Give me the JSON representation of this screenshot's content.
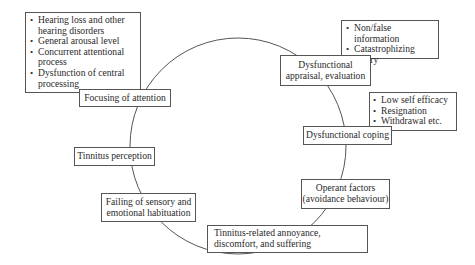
{
  "diagram": {
    "type": "cyclical model",
    "cycle_nodes": [
      {
        "id": "focusing",
        "label": "Focusing of attention"
      },
      {
        "id": "appraisal",
        "label_lines": [
          "Dysfunctional",
          "appraisal, evaluation"
        ]
      },
      {
        "id": "coping",
        "label": "Dysfunctional coping"
      },
      {
        "id": "operant",
        "label_lines": [
          "Operant factors",
          "(avoidance behaviour)"
        ]
      },
      {
        "id": "annoyance",
        "label_lines": [
          "Tinnitus-related annoyance,",
          "discomfort, and suffering"
        ]
      },
      {
        "id": "habituation",
        "label_lines": [
          "Failing of sensory and",
          "emotional habituation"
        ]
      },
      {
        "id": "perception",
        "label": "Tinnitus perception"
      }
    ],
    "annotations": {
      "focusing": [
        "Hearing loss and other hearing disorders",
        "General arousal level",
        "Concurrent attentional process",
        "Dysfunction of central processing"
      ],
      "appraisal": [
        "Non/false information",
        "Catastrophizing",
        "Worry"
      ],
      "coping": [
        "Low self efficacy",
        "Resignation",
        "Withdrawal etc."
      ]
    },
    "colors": {
      "line": "#555555",
      "text": "#2a2a2a",
      "background": "#ffffff"
    }
  }
}
